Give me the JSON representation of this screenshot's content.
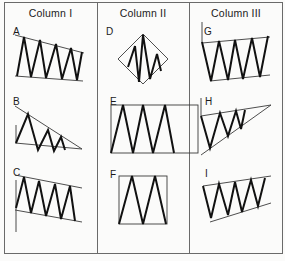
{
  "columns": [
    {
      "title": "Column I",
      "x": 51
    },
    {
      "title": "Column II",
      "x": 143
    },
    {
      "title": "Column III",
      "x": 237
    }
  ],
  "figures": [
    {
      "label": "A",
      "label_pos": [
        13,
        26
      ],
      "bounds": [
        [
          [
            15,
            35
          ],
          [
            84,
            53
          ]
        ],
        [
          [
            15,
            76
          ],
          [
            83,
            81
          ]
        ]
      ],
      "zigzag": [
        [
          17,
          76
        ],
        [
          24,
          37
        ],
        [
          31,
          77
        ],
        [
          40,
          40
        ],
        [
          46,
          78
        ],
        [
          56,
          44
        ],
        [
          62,
          79
        ],
        [
          71,
          48
        ],
        [
          77,
          80
        ],
        [
          82,
          52
        ]
      ]
    },
    {
      "label": "B",
      "label_pos": [
        13,
        96
      ],
      "bounds": [
        [
          [
            15,
            106
          ],
          [
            82,
            149
          ]
        ],
        [
          [
            15,
            143
          ],
          [
            82,
            149
          ]
        ]
      ],
      "zigzag": [
        [
          16,
          143
        ],
        [
          28,
          114
        ],
        [
          38,
          150
        ],
        [
          48,
          130
        ],
        [
          54,
          151
        ],
        [
          61,
          137
        ],
        [
          65,
          150
        ]
      ],
      "axis": [
        [
          16,
          125
        ],
        [
          16,
          143
        ]
      ]
    },
    {
      "label": "C",
      "label_pos": [
        13,
        167
      ],
      "bounds": [
        [
          [
            15,
            175
          ],
          [
            82,
            188
          ]
        ],
        [
          [
            15,
            210
          ],
          [
            82,
            222
          ]
        ]
      ],
      "zigzag": [
        [
          16,
          208
        ],
        [
          24,
          177
        ],
        [
          31,
          213
        ],
        [
          39,
          181
        ],
        [
          46,
          216
        ],
        [
          55,
          184
        ],
        [
          61,
          219
        ],
        [
          70,
          186
        ],
        [
          75,
          221
        ]
      ],
      "axis": [
        [
          16,
          180
        ],
        [
          16,
          232
        ]
      ]
    },
    {
      "label": "D",
      "label_pos": [
        106,
        26
      ],
      "diamond": [
        [
          143,
          34
        ],
        [
          168,
          59
        ],
        [
          143,
          84
        ],
        [
          118,
          59
        ]
      ],
      "zigzag": [
        [
          128,
          67
        ],
        [
          135,
          46
        ],
        [
          139,
          82
        ],
        [
          143,
          35
        ],
        [
          150,
          79
        ],
        [
          157,
          54
        ],
        [
          161,
          71
        ]
      ]
    },
    {
      "label": "E",
      "label_pos": [
        110,
        96
      ],
      "rect": [
        111,
        105,
        87,
        48
      ],
      "zigzag": [
        [
          111,
          153
        ],
        [
          123,
          105
        ],
        [
          133,
          153
        ],
        [
          143,
          105
        ],
        [
          153,
          153
        ],
        [
          165,
          105
        ],
        [
          174,
          153
        ]
      ]
    },
    {
      "label": "F",
      "label_pos": [
        110,
        169
      ],
      "rect": [
        119,
        176,
        48,
        48
      ],
      "zigzag": [
        [
          119,
          224
        ],
        [
          132,
          176
        ],
        [
          143,
          224
        ],
        [
          155,
          176
        ],
        [
          166,
          224
        ]
      ]
    },
    {
      "label": "G",
      "label_pos": [
        204,
        26
      ],
      "bounds": [
        [
          [
            202,
            43
          ],
          [
            270,
            37
          ]
        ],
        [
          [
            210,
            81
          ],
          [
            270,
            75
          ]
        ]
      ],
      "zigzag": [
        [
          202,
          42
        ],
        [
          211,
          81
        ],
        [
          219,
          41
        ],
        [
          228,
          80
        ],
        [
          235,
          40
        ],
        [
          243,
          79
        ],
        [
          252,
          38
        ],
        [
          260,
          77
        ],
        [
          268,
          36
        ]
      ],
      "axis": [
        [
          202,
          22
        ],
        [
          202,
          43
        ]
      ]
    },
    {
      "label": "H",
      "label_pos": [
        205,
        96
      ],
      "bounds": [
        [
          [
            201,
            116
          ],
          [
            271,
            105
          ]
        ],
        [
          [
            201,
            155
          ],
          [
            271,
            105
          ]
        ]
      ],
      "zigzag": [
        [
          201,
          116
        ],
        [
          210,
          148
        ],
        [
          220,
          113
        ],
        [
          228,
          136
        ],
        [
          236,
          111
        ],
        [
          241,
          129
        ],
        [
          245,
          110
        ]
      ],
      "axis": [
        [
          201,
          98
        ],
        [
          201,
          116
        ]
      ]
    },
    {
      "label": "I",
      "label_pos": [
        205,
        168
      ],
      "bounds": [
        [
          [
            203,
            186
          ],
          [
            271,
            176
          ]
        ],
        [
          [
            210,
            222
          ],
          [
            271,
            203
          ]
        ]
      ],
      "zigzag": [
        [
          203,
          186
        ],
        [
          211,
          218
        ],
        [
          219,
          184
        ],
        [
          228,
          215
        ],
        [
          235,
          182
        ],
        [
          242,
          212
        ],
        [
          251,
          180
        ],
        [
          258,
          206
        ],
        [
          265,
          178
        ]
      ]
    }
  ],
  "colors": {
    "frame": "#6a6a6a",
    "zigzag": "#111111",
    "bound": "#3a3a3a",
    "background": "#fbfbfa"
  }
}
